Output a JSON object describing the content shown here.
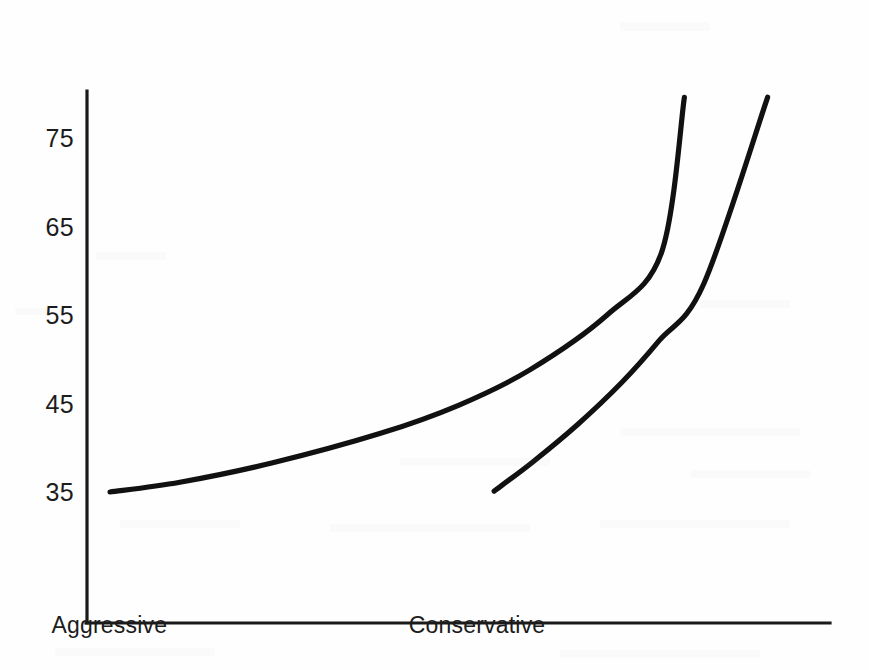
{
  "chart_data": {
    "type": "line",
    "title": "",
    "subtitle": "",
    "xlabel": "",
    "ylabel": "",
    "grid": false,
    "legend": "none",
    "xlim": [
      0,
      1
    ],
    "ylim": [
      30,
      80
    ],
    "y_ticks": [
      35,
      45,
      55,
      65,
      75
    ],
    "y_tick_labels": [
      "35",
      "45",
      "55",
      "65",
      "75"
    ],
    "x_tick_labels": [
      "Aggressive",
      "Conservative"
    ],
    "x_tick_positions": [
      0.03,
      0.525
    ],
    "series": [
      {
        "name": "curve-1",
        "color": "#111111",
        "x": [
          0.031,
          0.125,
          0.25,
          0.394,
          0.5,
          0.596,
          0.7,
          0.773,
          0.804
        ],
        "y": [
          35.0,
          36.1,
          38.3,
          41.6,
          44.8,
          48.8,
          55.0,
          62.0,
          79.6
        ]
      },
      {
        "name": "curve-2",
        "color": "#111111",
        "x": [
          0.548,
          0.6,
          0.66,
          0.72,
          0.77,
          0.83,
          0.916
        ],
        "y": [
          35.1,
          38.4,
          42.6,
          47.4,
          52.1,
          58.5,
          79.6
        ]
      }
    ],
    "axes": {
      "y_axis_top_value": 80.3,
      "y_axis_bottom_value": 20.2,
      "x_axis_left": 0.0,
      "x_axis_right": 1.0,
      "axis_color": "#1a1a1a"
    }
  },
  "colors": {
    "background": "#fefefe",
    "ink": "#111111",
    "axis": "#1a1a1a",
    "label": "#1c1c1c"
  }
}
